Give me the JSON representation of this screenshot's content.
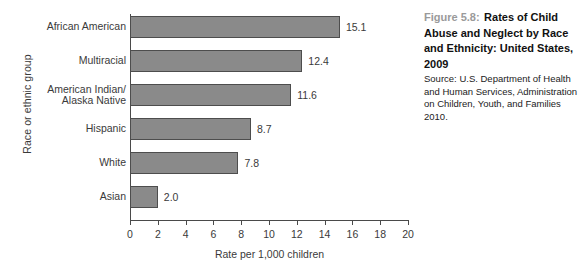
{
  "chart_data": {
    "type": "bar",
    "orientation": "horizontal",
    "title": "Rates of Child Abuse and Neglect by Race and Ethnicity: United States, 2009",
    "xlabel": "Rate per 1,000 children",
    "ylabel": "Race or ethnic group",
    "categories": [
      "African American",
      "Multiracial",
      "American Indian/\nAlaska Native",
      "Hispanic",
      "White",
      "Asian"
    ],
    "values": [
      15.1,
      12.4,
      11.6,
      8.7,
      7.8,
      2.0
    ],
    "value_labels": [
      "15.1",
      "12.4",
      "11.6",
      "8.7",
      "7.8",
      "2.0"
    ],
    "xlim": [
      0,
      20
    ],
    "xticks": [
      0,
      2,
      4,
      6,
      8,
      10,
      12,
      14,
      16,
      18,
      20
    ],
    "xtick_labels": [
      "0",
      "2",
      "4",
      "6",
      "8",
      "10",
      "12",
      "14",
      "16",
      "18",
      "20"
    ],
    "grid": false,
    "legend": null,
    "bar_fill_color": "#8a8a8a",
    "bar_edge_color": "#4d4d4d",
    "axis_color": "#4a4a4a"
  },
  "caption": {
    "figure_number": "Figure 5.8:",
    "title": "Rates of Child Abuse and Neglect by Race and Ethnicity: United States, 2009",
    "source": "Source: U.S. Department of Health and Human Services, Administration on Children, Youth, and Families 2010.",
    "figure_number_color": "#9a9a9a",
    "title_color": "#111111"
  }
}
